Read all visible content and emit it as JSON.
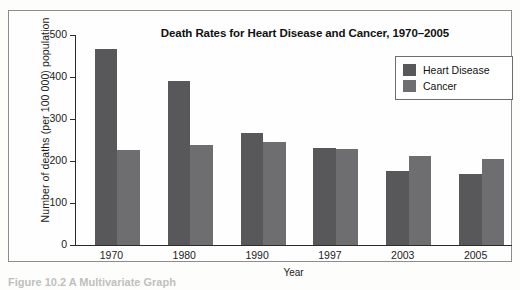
{
  "chart_data": {
    "type": "bar",
    "title": "Death Rates for Heart Disease and Cancer, 1970–2005",
    "xlabel": "Year",
    "ylabel": "Number of deaths (per 100 000) population",
    "categories": [
      "1970",
      "1980",
      "1990",
      "1997",
      "2003",
      "2005"
    ],
    "series": [
      {
        "name": "Heart Disease",
        "color": "#58585a",
        "values": [
          467,
          390,
          267,
          230,
          176,
          168
        ]
      },
      {
        "name": "Cancer",
        "color": "#6e6e70",
        "values": [
          226,
          239,
          246,
          228,
          213,
          205
        ]
      }
    ],
    "ylim": [
      0,
      500
    ],
    "yticks": [
      0,
      100,
      200,
      300,
      400,
      500
    ],
    "ytick_labels": [
      "0",
      "100",
      "200",
      "300",
      "400",
      "500"
    ],
    "grid": false,
    "legend_position": "top-right"
  },
  "legend": {
    "entries": [
      {
        "label": "Heart Disease",
        "swatch_color": "#58585a"
      },
      {
        "label": "Cancer",
        "swatch_color": "#6e6e70"
      }
    ]
  },
  "caption": {
    "text": "Figure 10.2  A Multivariate Graph"
  },
  "colors": {
    "axis": "#2b2b2b",
    "frame": "#8d8d8d",
    "text": "#1b1b1b",
    "background": "#fefefe"
  }
}
